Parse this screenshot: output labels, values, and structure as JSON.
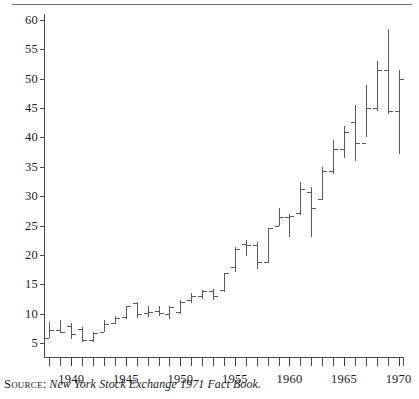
{
  "source": {
    "label": "Source:",
    "text": "New York Stock Exchange 1971 Fact Book."
  },
  "chart_data": {
    "type": "bar",
    "subtype": "high-low-open-close",
    "title": "",
    "xlabel": "",
    "ylabel": "",
    "xlim": [
      1937.5,
      1970.5
    ],
    "ylim": [
      2.5,
      61
    ],
    "grid": false,
    "legend": null,
    "ytick_values": [
      5,
      10,
      15,
      20,
      25,
      30,
      35,
      40,
      45,
      50,
      55,
      60
    ],
    "ytick_labels": [
      "5",
      "10",
      "15",
      "20",
      "25",
      "30",
      "35",
      "40",
      "45",
      "50",
      "55",
      "60"
    ],
    "xtick_values": [
      1938,
      1939,
      1940,
      1941,
      1942,
      1943,
      1944,
      1945,
      1946,
      1947,
      1948,
      1949,
      1950,
      1951,
      1952,
      1953,
      1954,
      1955,
      1956,
      1957,
      1958,
      1959,
      1960,
      1961,
      1962,
      1963,
      1964,
      1965,
      1966,
      1967,
      1968,
      1969,
      1970
    ],
    "xtick_labeled": [
      1940,
      1945,
      1950,
      1955,
      1960,
      1965,
      1970
    ],
    "xtick_labels": [
      "1940",
      "1945",
      "1950",
      "1955",
      "1960",
      "1965",
      "1970"
    ],
    "series": [
      {
        "name": "NYSE composite price range",
        "x": [
          1938,
          1939,
          1940,
          1941,
          1942,
          1943,
          1944,
          1945,
          1946,
          1947,
          1948,
          1949,
          1950,
          1951,
          1952,
          1953,
          1954,
          1955,
          1956,
          1957,
          1958,
          1959,
          1960,
          1961,
          1962,
          1963,
          1964,
          1965,
          1966,
          1967,
          1968,
          1969,
          1970
        ],
        "high": [
          8.6,
          8.9,
          8.4,
          7.8,
          7.0,
          9.0,
          9.6,
          11.4,
          12.1,
          11.3,
          11.4,
          11.3,
          12.4,
          13.6,
          14.0,
          14.2,
          17.0,
          21.4,
          22.5,
          22.2,
          24.6,
          28.0,
          27.0,
          32.5,
          31.5,
          35.0,
          39.5,
          42.0,
          45.5,
          49.0,
          53.0,
          58.5,
          51.5
        ],
        "low": [
          5.9,
          6.8,
          5.7,
          5.3,
          5.3,
          6.9,
          8.3,
          9.2,
          9.3,
          9.5,
          9.6,
          9.2,
          10.0,
          11.8,
          12.5,
          12.3,
          13.7,
          17.2,
          19.9,
          17.6,
          18.7,
          24.9,
          23.0,
          26.8,
          23.0,
          29.3,
          33.8,
          36.5,
          36.0,
          40.0,
          44.5,
          44.0,
          37.2
        ],
        "open": [
          5.9,
          7.2,
          8.0,
          7.4,
          5.5,
          7.0,
          8.4,
          9.4,
          11.8,
          10.1,
          10.5,
          10.0,
          10.3,
          12.3,
          13.1,
          13.9,
          14.0,
          18.0,
          21.9,
          21.8,
          18.9,
          25.0,
          26.5,
          27.2,
          30.8,
          29.6,
          34.3,
          38.0,
          42.6,
          39.0,
          45.0,
          51.5,
          44.5
        ],
        "close": [
          7.2,
          7.0,
          6.6,
          5.5,
          6.7,
          8.3,
          9.3,
          11.4,
          10.0,
          10.4,
          10.1,
          11.1,
          12.1,
          13.1,
          13.9,
          13.0,
          17.0,
          21.0,
          21.8,
          18.9,
          24.6,
          26.5,
          26.6,
          31.2,
          28.0,
          34.3,
          38.0,
          41.0,
          39.0,
          45.0,
          51.5,
          44.5,
          50.0
        ]
      }
    ]
  }
}
